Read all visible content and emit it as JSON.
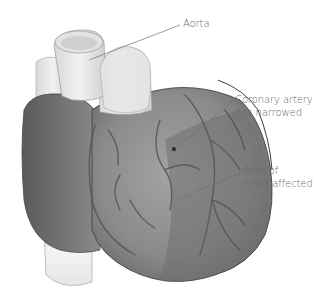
{
  "diagram": {
    "labels": {
      "aorta": {
        "lines": [
          "Aorta"
        ]
      },
      "coronary": {
        "lines": [
          "Coronary artery",
          "has narrowed"
        ]
      },
      "affected": {
        "lines": [
          "Area of",
          "heart affected"
        ]
      }
    },
    "colors": {
      "background": "#ffffff",
      "heart_dark": "#6f6f6f",
      "heart_mid": "#8c8c8c",
      "vessel_light": "#e8e8e8",
      "leader_line": "#707070",
      "label_text": "#6a6a6a"
    }
  }
}
